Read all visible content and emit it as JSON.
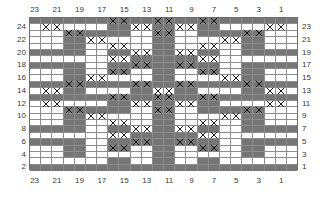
{
  "chart_data": {
    "type": "heatmap",
    "title": "",
    "xlabel": "",
    "ylabel": "",
    "grid": true,
    "columns": 24,
    "rows": 24,
    "legend_position": "none",
    "colors": {
      "filled": "#767676",
      "empty": "#ffffff",
      "mark": "#1c1c1c",
      "gridline": "#8d8d8d",
      "border": "#6e6e6e",
      "label": "#3a3a3a"
    },
    "symbols": {
      "0": "empty-cell",
      "1": "filled-cell",
      "2": "empty-cell-with-x",
      "3": "filled-cell-with-x"
    },
    "top_column_labels": [
      "23",
      "21",
      "19",
      "17",
      "15",
      "13",
      "11",
      "9",
      "7",
      "5",
      "3",
      "1"
    ],
    "bottom_column_labels": [
      "23",
      "21",
      "19",
      "17",
      "15",
      "13",
      "11",
      "9",
      "7",
      "5",
      "3",
      "1"
    ],
    "left_row_labels": [
      "24",
      "22",
      "20",
      "18",
      "16",
      "14",
      "12",
      "10",
      "8",
      "6",
      "4",
      "2"
    ],
    "right_row_labels": [
      "23",
      "21",
      "19",
      "17",
      "15",
      "13",
      "11",
      "9",
      "7",
      "5",
      "3",
      "1"
    ],
    "cells": [
      [
        1,
        1,
        1,
        1,
        1,
        1,
        1,
        3,
        3,
        1,
        1,
        3,
        3,
        1,
        1,
        3,
        3,
        1,
        1,
        1,
        1,
        1,
        1,
        1
      ],
      [
        0,
        2,
        2,
        0,
        0,
        0,
        0,
        1,
        1,
        2,
        2,
        1,
        1,
        2,
        2,
        1,
        1,
        0,
        0,
        0,
        0,
        2,
        2,
        0
      ],
      [
        0,
        0,
        0,
        3,
        3,
        1,
        1,
        1,
        1,
        0,
        0,
        3,
        3,
        0,
        0,
        1,
        1,
        1,
        1,
        3,
        3,
        0,
        0,
        0
      ],
      [
        0,
        0,
        0,
        1,
        1,
        2,
        2,
        0,
        0,
        0,
        0,
        1,
        1,
        0,
        0,
        0,
        0,
        2,
        2,
        1,
        1,
        0,
        0,
        0
      ],
      [
        0,
        0,
        0,
        1,
        1,
        0,
        0,
        2,
        2,
        0,
        0,
        1,
        1,
        0,
        0,
        2,
        2,
        0,
        0,
        1,
        1,
        0,
        0,
        0
      ],
      [
        1,
        1,
        1,
        1,
        1,
        0,
        0,
        1,
        1,
        2,
        2,
        1,
        1,
        2,
        2,
        1,
        1,
        0,
        0,
        1,
        1,
        1,
        1,
        1
      ],
      [
        0,
        0,
        0,
        0,
        0,
        0,
        0,
        2,
        2,
        1,
        1,
        1,
        1,
        1,
        1,
        2,
        2,
        0,
        0,
        0,
        0,
        0,
        0,
        0
      ],
      [
        1,
        1,
        1,
        1,
        1,
        0,
        0,
        1,
        1,
        3,
        3,
        1,
        1,
        3,
        3,
        1,
        1,
        0,
        0,
        1,
        1,
        1,
        1,
        1
      ],
      [
        0,
        0,
        0,
        1,
        1,
        0,
        0,
        3,
        3,
        0,
        0,
        1,
        1,
        0,
        0,
        3,
        3,
        0,
        0,
        1,
        1,
        0,
        0,
        0
      ],
      [
        0,
        0,
        0,
        1,
        1,
        2,
        2,
        0,
        0,
        0,
        0,
        1,
        1,
        0,
        0,
        0,
        0,
        2,
        2,
        1,
        1,
        0,
        0,
        0
      ],
      [
        1,
        1,
        1,
        3,
        3,
        1,
        1,
        1,
        1,
        3,
        3,
        1,
        1,
        3,
        3,
        1,
        1,
        1,
        1,
        3,
        3,
        1,
        1,
        1
      ],
      [
        0,
        2,
        2,
        1,
        1,
        0,
        0,
        0,
        0,
        1,
        1,
        2,
        2,
        1,
        1,
        0,
        0,
        0,
        0,
        1,
        1,
        2,
        2,
        0
      ],
      [
        1,
        1,
        1,
        1,
        1,
        1,
        1,
        3,
        3,
        1,
        1,
        3,
        3,
        1,
        1,
        3,
        3,
        1,
        1,
        1,
        1,
        1,
        1,
        1
      ],
      [
        0,
        2,
        2,
        0,
        0,
        0,
        0,
        1,
        1,
        2,
        2,
        1,
        1,
        2,
        2,
        1,
        1,
        0,
        0,
        0,
        0,
        2,
        2,
        0
      ],
      [
        0,
        0,
        0,
        3,
        3,
        1,
        1,
        1,
        1,
        0,
        0,
        3,
        3,
        0,
        0,
        1,
        1,
        1,
        1,
        3,
        3,
        0,
        0,
        0
      ],
      [
        0,
        0,
        0,
        1,
        1,
        2,
        2,
        0,
        0,
        0,
        0,
        1,
        1,
        0,
        0,
        0,
        0,
        2,
        2,
        1,
        1,
        0,
        0,
        0
      ],
      [
        0,
        0,
        0,
        1,
        1,
        0,
        0,
        2,
        2,
        0,
        0,
        1,
        1,
        0,
        0,
        2,
        2,
        0,
        0,
        1,
        1,
        0,
        0,
        0
      ],
      [
        1,
        1,
        1,
        1,
        1,
        0,
        0,
        1,
        1,
        2,
        2,
        1,
        1,
        2,
        2,
        1,
        1,
        0,
        0,
        1,
        1,
        1,
        1,
        1
      ],
      [
        0,
        0,
        0,
        0,
        0,
        0,
        0,
        2,
        2,
        1,
        1,
        1,
        1,
        1,
        1,
        2,
        2,
        0,
        0,
        0,
        0,
        0,
        0,
        0
      ],
      [
        1,
        1,
        1,
        1,
        1,
        0,
        0,
        1,
        1,
        3,
        3,
        1,
        1,
        3,
        3,
        1,
        1,
        0,
        0,
        1,
        1,
        1,
        1,
        1
      ],
      [
        0,
        0,
        0,
        1,
        1,
        0,
        0,
        3,
        3,
        0,
        0,
        1,
        1,
        0,
        0,
        3,
        3,
        0,
        0,
        1,
        1,
        0,
        0,
        0
      ],
      [
        0,
        0,
        0,
        1,
        1,
        0,
        0,
        0,
        0,
        0,
        0,
        1,
        1,
        0,
        0,
        0,
        0,
        0,
        0,
        1,
        1,
        0,
        0,
        0
      ],
      [
        0,
        0,
        0,
        0,
        0,
        0,
        0,
        1,
        1,
        0,
        0,
        1,
        1,
        0,
        0,
        1,
        1,
        0,
        0,
        0,
        0,
        0,
        0,
        0
      ],
      [
        1,
        1,
        1,
        1,
        1,
        1,
        1,
        1,
        1,
        1,
        1,
        1,
        1,
        1,
        1,
        1,
        1,
        1,
        1,
        1,
        1,
        1,
        1,
        1
      ]
    ]
  }
}
